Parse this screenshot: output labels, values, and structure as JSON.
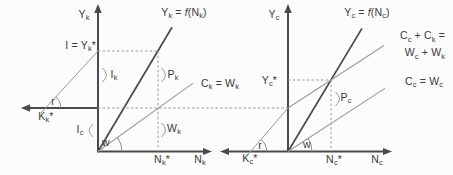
{
  "figure": {
    "colors": {
      "background": "#fcfcfc",
      "axis": "#4a4a4a",
      "main_line": "#4a4a4a",
      "thin_line": "#9a9a9a",
      "dashed_line": "#9a9a9a",
      "text": "#3a3a3a"
    },
    "left_panel": {
      "y_axis_label": [
        {
          "t": "Y"
        },
        {
          "t": "k",
          "s": "sub"
        }
      ],
      "n_axis_label": [
        {
          "t": "N"
        },
        {
          "t": "k",
          "s": "sub"
        }
      ],
      "n_star_label": [
        {
          "t": "N"
        },
        {
          "t": "k",
          "s": "sub"
        },
        {
          "t": "*"
        }
      ],
      "capital_axis_label": [
        {
          "t": "K"
        },
        {
          "t": "k",
          "s": "sub"
        },
        {
          "t": "*"
        }
      ],
      "production_fn_label": [
        {
          "t": "Y"
        },
        {
          "t": "k",
          "s": "sub"
        },
        {
          "t": " = "
        },
        {
          "t": "f",
          "s": "ital"
        },
        {
          "t": "(N"
        },
        {
          "t": "k",
          "s": "sub"
        },
        {
          "t": ")"
        }
      ],
      "consumption_line_label": [
        {
          "t": "C"
        },
        {
          "t": "k",
          "s": "sub"
        },
        {
          "t": " = W"
        },
        {
          "t": "k",
          "s": "sub"
        }
      ],
      "investment_eq_label": [
        {
          "t": "I = Y"
        },
        {
          "t": "k",
          "s": "sub"
        },
        {
          "t": "*"
        }
      ],
      "profit_brace_label": [
        {
          "t": "P"
        },
        {
          "t": "k",
          "s": "sub"
        }
      ],
      "wage_brace_label": [
        {
          "t": "W"
        },
        {
          "t": "k",
          "s": "sub"
        }
      ],
      "investment_k_brace_label": [
        {
          "t": "I"
        },
        {
          "t": "k",
          "s": "sub"
        }
      ],
      "investment_c_brace_label": [
        {
          "t": "I"
        },
        {
          "t": "c",
          "s": "sub"
        }
      ],
      "r_angle_label": [
        {
          "t": "r"
        }
      ],
      "w_angle_label": [
        {
          "t": "w"
        }
      ]
    },
    "right_panel": {
      "y_axis_label": [
        {
          "t": "Y"
        },
        {
          "t": "c",
          "s": "sub"
        }
      ],
      "n_axis_label": [
        {
          "t": "N"
        },
        {
          "t": "c",
          "s": "sub"
        }
      ],
      "n_star_label": [
        {
          "t": "N"
        },
        {
          "t": "c",
          "s": "sub"
        },
        {
          "t": "*"
        }
      ],
      "capital_axis_label": [
        {
          "t": "K"
        },
        {
          "t": "c",
          "s": "sub"
        },
        {
          "t": "*"
        }
      ],
      "y_star_label": [
        {
          "t": "Y"
        },
        {
          "t": "c",
          "s": "sub"
        },
        {
          "t": "*"
        }
      ],
      "production_fn_label": [
        {
          "t": "Y"
        },
        {
          "t": "c",
          "s": "sub"
        },
        {
          "t": " = "
        },
        {
          "t": "f",
          "s": "ital"
        },
        {
          "t": "(N"
        },
        {
          "t": "c",
          "s": "sub"
        },
        {
          "t": ")"
        }
      ],
      "aggregate_consumption_label_line1": [
        {
          "t": "C"
        },
        {
          "t": "c",
          "s": "sub"
        },
        {
          "t": " + C"
        },
        {
          "t": "k",
          "s": "sub"
        },
        {
          "t": " ="
        }
      ],
      "aggregate_consumption_label_line2": [
        {
          "t": "W"
        },
        {
          "t": "c",
          "s": "sub"
        },
        {
          "t": " + W"
        },
        {
          "t": "k",
          "s": "sub"
        }
      ],
      "consumption_line_label": [
        {
          "t": "C"
        },
        {
          "t": "c",
          "s": "sub"
        },
        {
          "t": " = W"
        },
        {
          "t": "c",
          "s": "sub"
        }
      ],
      "profit_brace_label": [
        {
          "t": "P"
        },
        {
          "t": "c",
          "s": "sub"
        }
      ],
      "r_angle_label": [
        {
          "t": "r"
        }
      ],
      "w_angle_label": [
        {
          "t": "w"
        }
      ]
    }
  }
}
